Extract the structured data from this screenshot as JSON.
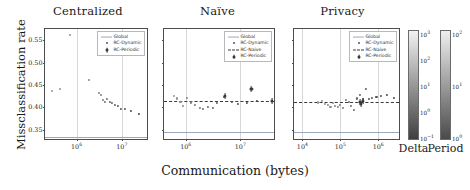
{
  "figure": {
    "xlabel": "Communication (bytes)",
    "ylabel": "Missclassification rate"
  },
  "chart_data": {
    "type": "scatter",
    "title": "",
    "xlabel": "Communication (bytes)",
    "ylabel": "Missclassification rate",
    "xscale": "log",
    "yscale": "linear",
    "ylim": [
      0.325,
      0.575
    ],
    "yticks": [
      0.35,
      0.4,
      0.45,
      0.5,
      0.55
    ],
    "ytick_labels": [
      "0.35",
      "0.40",
      "0.45",
      "0.50",
      "0.55"
    ],
    "grid": "vertical-only",
    "legend_position": "upper right",
    "panels": [
      {
        "title": "Centralized",
        "xlim": [
          200000.0,
          40000000.0
        ],
        "xticks": [
          1000000.0,
          10000000.0
        ],
        "xtick_labels": [
          "10⁶",
          "10⁷"
        ],
        "legend": [
          "Global",
          "RC-Dynamic",
          "RC-Periodic"
        ],
        "global_value": 0.335,
        "series": [
          {
            "name": "RC-Dynamic",
            "x": [
              290000,
              430000,
              700000,
              1900000,
              3100000,
              3500000,
              3900000,
              4300000,
              4700000,
              5400000,
              6200000,
              7000000,
              8200000,
              9600000,
              12000000,
              16000000,
              24000000
            ],
            "y": [
              0.437,
              0.441,
              0.561,
              0.461,
              0.433,
              0.427,
              0.417,
              0.413,
              0.419,
              0.412,
              0.409,
              0.406,
              0.403,
              0.397,
              0.396,
              0.393,
              0.385
            ]
          }
        ]
      },
      {
        "title": "Naïve",
        "xlim": [
          400000.0,
          45000000.0
        ],
        "xticks": [
          1000000.0,
          10000000.0
        ],
        "xtick_labels": [
          "10⁶",
          "10⁷"
        ],
        "legend": [
          "Global",
          "RC-Dynamic",
          "RC-Naive",
          "RC-Periodic"
        ],
        "global_value": 0.345,
        "naive_value": 0.414,
        "series": [
          {
            "name": "RC-Dynamic",
            "x": [
              610000,
              700000,
              800000,
              900000,
              1050000,
              1250000,
              1500000,
              1800000,
              2100000,
              2600000,
              3100000,
              3800000,
              5000000,
              7000000,
              9000000,
              13000000,
              20000000
            ],
            "y": [
              0.425,
              0.42,
              0.412,
              0.404,
              0.422,
              0.411,
              0.406,
              0.398,
              0.396,
              0.401,
              0.398,
              0.409,
              0.423,
              0.412,
              0.407,
              0.41,
              0.414
            ]
          },
          {
            "name": "RC-Periodic",
            "x": [
              5200000,
              16000000,
              38000000
            ],
            "y": [
              0.425,
              0.441,
              0.414
            ]
          }
        ]
      },
      {
        "title": "Privacy",
        "xlim": [
          6000.0,
          4000000.0
        ],
        "xticks": [
          10000.0,
          100000.0,
          1000000.0
        ],
        "xtick_labels": [
          "10⁴",
          "10⁵",
          "10⁶"
        ],
        "legend": [
          "Global",
          "RC-Dynamic",
          "RC-Naive",
          "RC-Periodic"
        ],
        "global_value": 0.345,
        "naive_value": 0.412,
        "series": [
          {
            "name": "RC-Dynamic",
            "x": [
              26000,
              33000,
              40000,
              47000,
              55000,
              64000,
              74000,
              86000,
              100000,
              120000,
              140000,
              165000,
              195000,
              230000,
              275000,
              330000,
              400000,
              480000,
              580000,
              700000,
              900000,
              1200000,
              1700000,
              2600000
            ],
            "y": [
              0.411,
              0.415,
              0.408,
              0.405,
              0.402,
              0.409,
              0.404,
              0.4,
              0.406,
              0.398,
              0.416,
              0.413,
              0.404,
              0.395,
              0.42,
              0.427,
              0.418,
              0.441,
              0.419,
              0.421,
              0.424,
              0.425,
              0.428,
              0.422
            ]
          },
          {
            "name": "RC-Periodic",
            "x": [
              330000,
              360000,
              390000
            ],
            "y": [
              0.412,
              0.408,
              0.414
            ]
          }
        ]
      }
    ],
    "colorbars": [
      {
        "label": "Delta",
        "scale": "log",
        "ticks": [
          "10⁰⁻¹"
        ],
        "tick_labels": [
          "10³",
          "10²",
          "10¹",
          "10⁰",
          "10⁻¹"
        ],
        "vmin": "10^-1",
        "vmax": "10^3",
        "cmap": "gray-dark-to-light"
      },
      {
        "label": "Period",
        "scale": "log",
        "tick_labels": [
          "10²",
          "10¹",
          "10⁰"
        ],
        "vmin": "10^0",
        "vmax": "10^2",
        "cmap": "gray-dark-to-light"
      }
    ]
  },
  "colors": {
    "global_line": "#9aa9bd",
    "naive_line": "#3a3a3a",
    "marker": "#555555",
    "grid": "#d7d7d7",
    "axis": "#4d4d4d"
  }
}
